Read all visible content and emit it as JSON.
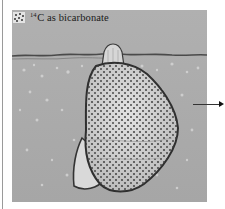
{
  "legend": {
    "icon": "dotted-square-icon",
    "isotope_mass": "14",
    "isotope_symbol": "C",
    "label_rest": " as bicarbonate",
    "label_full": "14C as bicarbonate"
  },
  "illustration": {
    "subject": "coral polyp cell filled with labeled carbon",
    "background_color": "#a9a9a9",
    "cell_fill": "#c9c9c9",
    "cell_outline": "#3a3a3a",
    "dot_color": "#3b3b3b"
  },
  "arrow": {
    "direction": "right",
    "color": "#222222"
  }
}
